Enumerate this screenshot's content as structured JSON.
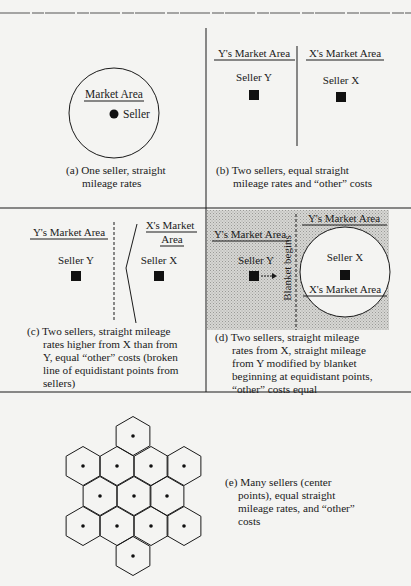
{
  "panels": {
    "a": {
      "market_label": "Market Area",
      "seller_label": "Seller",
      "caption_line1": "(a) One seller, straight",
      "caption_line2": "mileage rates"
    },
    "b": {
      "y_market_label": "Y's Market Area",
      "x_market_label": "X's Market Area",
      "seller_y_label": "Seller Y",
      "seller_x_label": "Seller X",
      "caption_line1": "(b) Two sellers, equal straight",
      "caption_line2": "mileage rates and “other” costs"
    },
    "c": {
      "y_market_label": "Y's Market Area",
      "x_market_label_line1": "X's Market",
      "x_market_label_line2": "Area",
      "seller_y_label": "Seller Y",
      "seller_x_label": "Seller X",
      "caption": "(c) Two sellers, straight mileage rates higher from X than from Y, equal “other” costs (broken line of equidistant points from sellers)",
      "caption_lines": [
        "(c) Two sellers, straight mileage",
        "rates higher from X than from",
        "Y, equal “other” costs (broken",
        "line of equidistant points from",
        "sellers)"
      ]
    },
    "d": {
      "y_market_label_top": "Y's Market Area",
      "y_market_label_left": "Y's Market Area",
      "x_market_label": "X's Market Area",
      "seller_y_label": "Seller Y",
      "seller_x_label": "Seller X",
      "blanket_label": "Blanket begins",
      "caption_lines": [
        "(d) Two sellers, straight mileage",
        "rates from X, straight mileage",
        "from Y modified by blanket",
        "beginning at equidistant points,",
        "“other” costs equal"
      ]
    },
    "e": {
      "caption_lines": [
        "(e) Many sellers (center",
        "points), equal straight",
        "mileage rates, and “other”",
        "costs"
      ],
      "hex_centers": [
        [
          133,
          436
        ],
        [
          83,
          466
        ],
        [
          117,
          466
        ],
        [
          151,
          466
        ],
        [
          184,
          466
        ],
        [
          100,
          496
        ],
        [
          134,
          496
        ],
        [
          167,
          496
        ],
        [
          83,
          526
        ],
        [
          117,
          526
        ],
        [
          151,
          526
        ],
        [
          184,
          526
        ],
        [
          133,
          556
        ]
      ]
    }
  },
  "colors": {
    "background": "#f4f4f2",
    "ink": "#1a1a1a",
    "shade": "#c9c9c6"
  }
}
